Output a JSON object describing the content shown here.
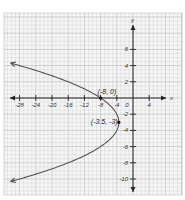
{
  "chart_data": {
    "type": "line",
    "title": "",
    "xlabel": "x",
    "ylabel": "y",
    "xlim": [
      -30,
      6
    ],
    "ylim": [
      -12,
      8
    ],
    "grid": true,
    "legend": null,
    "equation": "x = -0.5(y + 3)^2 - 3.5",
    "x_ticks": [
      -28,
      -24,
      -20,
      -16,
      -12,
      -8,
      -4,
      0,
      4
    ],
    "x_tick_labels": [
      "-28",
      "-24",
      "-20",
      "-16",
      "-12",
      "-8",
      "-4",
      "0",
      "4"
    ],
    "y_ticks": [
      6,
      4,
      2,
      -2,
      -4,
      -6,
      -8,
      -10
    ],
    "y_tick_labels": [
      "6",
      "4",
      "2",
      "2",
      "4",
      "6",
      "8",
      "10"
    ],
    "series": [
      {
        "name": "parabola",
        "color": "#555555",
        "opens": "left",
        "vertex": [
          -3.5,
          -3
        ],
        "a": 0.5,
        "y_range": [
          -10.3,
          4.3
        ],
        "arrows": "both"
      }
    ],
    "annotations": [
      {
        "label": "(-8, 0)",
        "x": -8,
        "y": 0
      },
      {
        "label": "(-3.5, -3)",
        "x": -3.5,
        "y": -3
      }
    ]
  },
  "layout": {
    "origin_px": [
      133,
      98
    ],
    "px_per_x": 4.05,
    "px_per_y": 8.1,
    "grid_left": 4,
    "grid_top": 13,
    "grid_right": 182,
    "grid_bottom": 195
  }
}
